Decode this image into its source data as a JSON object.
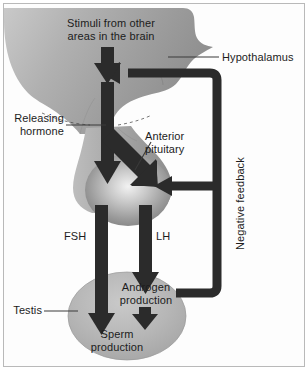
{
  "figure": {
    "kind": "flow-diagram"
  },
  "colors": {
    "arrow": "#2b2b2b",
    "brain_fill": "#a8a8a8",
    "pituitary_fill": "#9a9a9a",
    "testis_fill": "#b4b4b4",
    "text": "#1c1c1c",
    "frame": "#b9b9b9",
    "background": "#ffffff"
  },
  "labels": {
    "stimuli": "Stimuli from other\nareas in the brain",
    "hypothalamus": "Hypothalamus",
    "releasing_hormone": "Releasing\nhormone",
    "anterior_pituitary": "Anterior\npituitary",
    "negative_feedback": "Negative feedback",
    "fsh": "FSH",
    "lh": "LH",
    "testis": "Testis",
    "androgen_production": "Androgen\nproduction",
    "sperm_production": "Sperm\nproduction"
  },
  "structures": [
    {
      "name": "brain",
      "label": "Hypothalamus"
    },
    {
      "name": "anterior-pituitary",
      "label": "Anterior pituitary"
    },
    {
      "name": "testis",
      "label": "Testis"
    }
  ],
  "signals": [
    {
      "name": "stimuli",
      "from": "brain areas",
      "to": "hypothalamus",
      "label": "Stimuli from other areas in the brain"
    },
    {
      "name": "releasing-hormone",
      "from": "hypothalamus",
      "to": "anterior pituitary",
      "label": "Releasing hormone"
    },
    {
      "name": "fsh",
      "from": "anterior pituitary",
      "to": "sperm production",
      "label": "FSH"
    },
    {
      "name": "lh",
      "from": "anterior pituitary",
      "to": "androgen production",
      "label": "LH"
    },
    {
      "name": "androgen-to-sperm",
      "from": "androgen production",
      "to": "sperm production",
      "label": ""
    },
    {
      "name": "negative-feedback",
      "from": "androgen production",
      "to": "hypothalamus and anterior pituitary",
      "label": "Negative feedback"
    }
  ]
}
